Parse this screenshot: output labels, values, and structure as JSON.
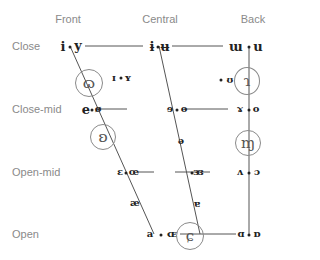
{
  "columns": [
    {
      "label": "Front",
      "x": 68
    },
    {
      "label": "Central",
      "x": 160
    },
    {
      "label": "Back",
      "x": 253
    }
  ],
  "rows": [
    {
      "label": "Close",
      "y": 46
    },
    {
      "label": "Close-mid",
      "y": 109
    },
    {
      "label": "Open-mid",
      "y": 172
    },
    {
      "label": "Open",
      "y": 234
    }
  ],
  "vowels": {
    "close": [
      {
        "unrounded": "i",
        "rounded": "y",
        "position": "front"
      },
      {
        "unrounded": "ɨ",
        "rounded": "ʉ",
        "position": "central"
      },
      {
        "unrounded": "ɯ",
        "rounded": "u",
        "position": "back"
      }
    ],
    "near_close": [
      {
        "unrounded": "ɪ",
        "rounded": "ʏ",
        "position": "near-front"
      },
      {
        "unrounded": "",
        "rounded": "ʊ",
        "position": "near-back"
      }
    ],
    "close_mid": [
      {
        "unrounded": "e",
        "rounded": "ø",
        "position": "front"
      },
      {
        "unrounded": "ɘ",
        "rounded": "ɵ",
        "position": "central"
      },
      {
        "unrounded": "ɤ",
        "rounded": "o",
        "position": "back"
      }
    ],
    "mid": [
      {
        "symbol": "ə",
        "position": "central"
      }
    ],
    "open_mid": [
      {
        "unrounded": "ɛ",
        "rounded": "œ",
        "position": "front"
      },
      {
        "unrounded": "ɜ",
        "rounded": "ɞ",
        "position": "central"
      },
      {
        "unrounded": "ʌ",
        "rounded": "ɔ",
        "position": "back"
      }
    ],
    "near_open": [
      {
        "symbol": "æ",
        "position": "front"
      },
      {
        "symbol": "ɐ",
        "position": "central"
      }
    ],
    "open": [
      {
        "unrounded": "a",
        "rounded": "ɶ",
        "position": "front"
      },
      {
        "unrounded": "ɑ",
        "rounded": "ɒ",
        "position": "back"
      }
    ]
  },
  "circled_symbols": [
    {
      "glyph": "ɷ",
      "note": "circled symbol between close and close-mid, front"
    },
    {
      "glyph": "ʚ",
      "note": "circled symbol between close-mid and open-mid, front"
    },
    {
      "glyph": "ɿ",
      "note": "circled symbol near-close back"
    },
    {
      "glyph": "ɱ",
      "note": "circled symbol below close-mid back"
    },
    {
      "glyph": "ɕ",
      "note": "circled symbol open central"
    }
  ],
  "colors": {
    "label_text": "#8a8a8a",
    "symbol_text": "#222222",
    "line": "#555555",
    "circle": "#8a8a8a",
    "background": "#ffffff"
  }
}
